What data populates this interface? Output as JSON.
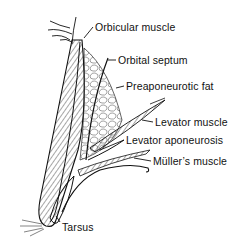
{
  "diagram": {
    "labels": [
      {
        "id": "orbicular",
        "text": "Orbicular muscle",
        "x": 95,
        "y": 21
      },
      {
        "id": "septum",
        "text": "Orbital septum",
        "x": 118,
        "y": 54
      },
      {
        "id": "fat",
        "text": "Preaponeurotic fat",
        "x": 126,
        "y": 80
      },
      {
        "id": "levator-muscle",
        "text": "Levator muscle",
        "x": 155,
        "y": 116
      },
      {
        "id": "levator-aponeurosis",
        "text": "Levator aponeurosis",
        "x": 126,
        "y": 134
      },
      {
        "id": "muller",
        "text": "Müller’s muscle",
        "x": 153,
        "y": 155
      },
      {
        "id": "tarsus",
        "text": "Tarsus",
        "x": 62,
        "y": 221
      }
    ],
    "colors": {
      "ink": "#111111",
      "background": "#ffffff"
    }
  }
}
